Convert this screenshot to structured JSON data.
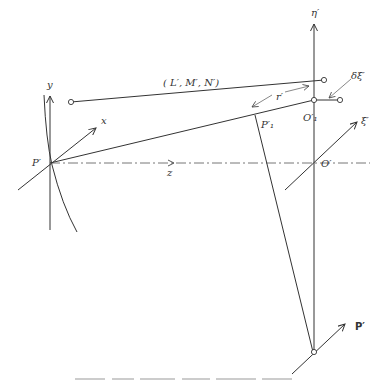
{
  "diagram": {
    "type": "optical ray geometry diagram",
    "labels": {
      "eta": "η′",
      "xi": "ξ′",
      "y_axis": "y",
      "x_axis": "x",
      "z_axis": "z",
      "P": "P′",
      "P1": "P′₁",
      "O": "O′",
      "O1": "O′₁",
      "direction_cosines": "( L′, M′, N′)",
      "r": "r′",
      "delta_xi": "δξ′",
      "P_bold": "P′"
    },
    "colors": {
      "line": "#333333",
      "background": "#ffffff"
    }
  }
}
